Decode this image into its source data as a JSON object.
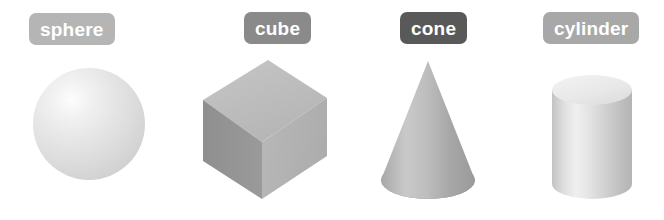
{
  "canvas": {
    "width": 664,
    "height": 220,
    "background": "#ffffff"
  },
  "shapes": [
    {
      "id": "sphere",
      "label": "sphere",
      "label_bg": "#b5b5b5",
      "label_text_color": "#ffffff",
      "body_light": "#fdfdfd",
      "body_dark": "#c6c6c6"
    },
    {
      "id": "cube",
      "label": "cube",
      "label_bg": "#8a8a8a",
      "label_text_color": "#ffffff",
      "face_top": "#bdbdbd",
      "face_right": "#b2b2b2",
      "face_left": "#949494"
    },
    {
      "id": "cone",
      "label": "cone",
      "label_bg": "#595959",
      "label_text_color": "#ffffff",
      "body_light": "#c9c9c9",
      "body_dark": "#a0a0a0",
      "base": "#8f8f8f"
    },
    {
      "id": "cylinder",
      "label": "cylinder",
      "label_bg": "#a8a8a8",
      "label_text_color": "#ffffff",
      "top_face": "#e8e8e8",
      "body_light": "#f0f0f0",
      "body_dark": "#b4b4b4"
    }
  ]
}
